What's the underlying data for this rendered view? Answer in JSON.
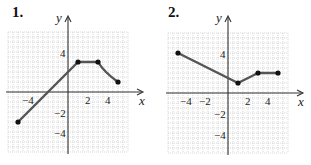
{
  "chart_data": [
    {
      "type": "line",
      "problem_label": "1.",
      "title": "",
      "xlabel": "x",
      "ylabel": "y",
      "xlim": [
        -6,
        6
      ],
      "ylim": [
        -6,
        6
      ],
      "grid": true,
      "x_tick_labels": [
        "−4",
        "2",
        "4"
      ],
      "y_tick_labels": [
        "4",
        "−2",
        "−4"
      ],
      "points": [
        [
          -5,
          -3
        ],
        [
          1,
          3
        ],
        [
          3,
          3
        ],
        [
          5,
          1
        ]
      ],
      "segments": [
        {
          "from": [
            -5,
            -3
          ],
          "to": [
            1,
            3
          ],
          "shape": "linear"
        },
        {
          "from": [
            1,
            3
          ],
          "to": [
            3,
            3
          ],
          "shape": "linear"
        },
        {
          "from": [
            3,
            3
          ],
          "to": [
            5,
            1
          ],
          "shape": "curve (concave up)"
        }
      ],
      "endpoints_closed": true
    },
    {
      "type": "line",
      "problem_label": "2.",
      "title": "",
      "xlabel": "x",
      "ylabel": "y",
      "xlim": [
        -6,
        6
      ],
      "ylim": [
        -6,
        6
      ],
      "grid": true,
      "x_tick_labels": [
        "−4",
        "−2",
        "2",
        "4"
      ],
      "y_tick_labels": [
        "4",
        "−2",
        "−4"
      ],
      "points": [
        [
          -5,
          4
        ],
        [
          1,
          1
        ],
        [
          3,
          2
        ],
        [
          5,
          2
        ]
      ],
      "segments": [
        {
          "from": [
            -5,
            4
          ],
          "to": [
            1,
            1
          ],
          "shape": "linear"
        },
        {
          "from": [
            1,
            1
          ],
          "to": [
            3,
            2
          ],
          "shape": "linear"
        },
        {
          "from": [
            3,
            2
          ],
          "to": [
            5,
            2
          ],
          "shape": "linear"
        }
      ],
      "endpoints_closed": true
    }
  ],
  "graph1": {
    "label": "1.",
    "xaxis_label": "x",
    "yaxis_label": "y",
    "xticks": {
      "n4": "−4",
      "p2": "2",
      "p4": "4"
    },
    "yticks": {
      "p4": "4",
      "n2": "−2",
      "n4": "−4"
    }
  },
  "graph2": {
    "label": "2.",
    "xaxis_label": "x",
    "yaxis_label": "y",
    "xticks": {
      "n4": "−4",
      "n2": "−2",
      "p2": "2",
      "p4": "4"
    },
    "yticks": {
      "p4": "4",
      "n2": "−2",
      "n4": "−4"
    }
  },
  "colors": {
    "curve": "#555555",
    "points": "#111111",
    "grid": "#bdbdbd",
    "axis": "#333333"
  }
}
